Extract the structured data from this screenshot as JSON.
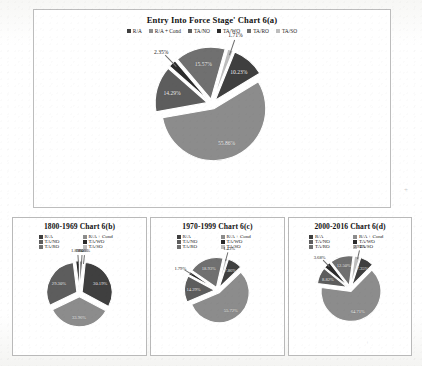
{
  "figure": {
    "palette": {
      "r_a": "#3f3f3f",
      "r_a_cond": "#8c8c8c",
      "ta_no": "#5d5d5d",
      "ta_wo": "#2b2b2b",
      "ta_ro": "#707070",
      "ta_so": "#bdbdbd",
      "frame_border": "#b9b9b9",
      "page_background": "#ffffff",
      "label_light": "#f2f2f2",
      "label_dark": "#1d1d1d"
    },
    "legend_labels": [
      "R/A",
      "R/A + Cond",
      "TA/NO",
      "TA/WO",
      "TA/RO",
      "TA/SO"
    ]
  },
  "chart_data": [
    {
      "type": "pie",
      "id": "chart-6a",
      "title": "Entry Into Force Stage' Chart 6(a)",
      "legend_position": "top",
      "categories": [
        "R/A",
        "R/A + Cond",
        "TA/NO",
        "TA/WO",
        "TA/RO",
        "TA/SO"
      ],
      "values": [
        10.23,
        55.86,
        14.29,
        2.35,
        15.57,
        1.71
      ],
      "labels": [
        "10.23%",
        "55.86%",
        "14.29%",
        "2.35%",
        "15.57%",
        "1.71%"
      ],
      "unit": "%"
    },
    {
      "type": "pie",
      "id": "chart-6b",
      "title": "1800-1969 Chart 6(b)",
      "legend_position": "top",
      "categories": [
        "R/A",
        "R/A + Cond",
        "TA/NO",
        "TA/WO",
        "TA/RO",
        "TA/SO"
      ],
      "values": [
        30.19,
        33.96,
        29.3,
        1.89,
        1.6,
        0.0
      ],
      "labels": [
        "30.19%",
        "33.96%",
        "29.30%",
        "1.89%",
        "1.60%",
        "0.00%"
      ],
      "unit": "%"
    },
    {
      "type": "pie",
      "id": "chart-6c",
      "title": "1970-1999 Chart 6(c)",
      "legend_position": "top",
      "categories": [
        "R/A",
        "R/A + Cond",
        "TA/NO",
        "TA/WO",
        "TA/RO",
        "TA/SO"
      ],
      "values": [
        7.86,
        55.72,
        14.29,
        1.79,
        18.93,
        1.43
      ],
      "labels": [
        "7.86%",
        "55.72%",
        "14.29%",
        "1.79%",
        "18.93%",
        "1.43%"
      ],
      "unit": "%"
    },
    {
      "type": "pie",
      "id": "chart-6d",
      "title": "2000-2016 Chart 6(d)",
      "legend_position": "top",
      "categories": [
        "R/A",
        "R/A + Cond",
        "TA/NO",
        "TA/WO",
        "TA/RO",
        "TA/SO"
      ],
      "values": [
        7.35,
        64.71,
        8.82,
        3.68,
        12.5,
        2.94
      ],
      "labels": [
        "7.35%",
        "64.71%",
        "8.82%",
        "3.68%",
        "12.50%",
        "2.94%"
      ],
      "unit": "%"
    }
  ],
  "artifacts": {
    "corner_mark": "+"
  }
}
